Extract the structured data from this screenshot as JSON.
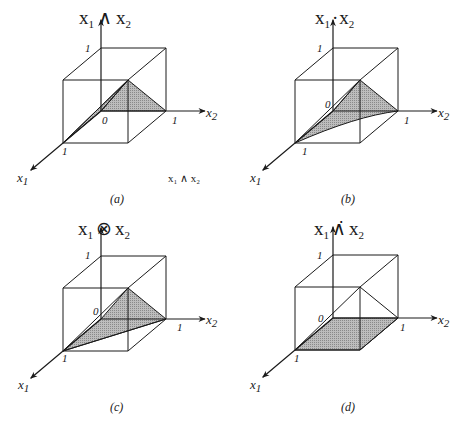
{
  "figure": {
    "panels": [
      {
        "id": "a",
        "title_base1": "x",
        "title_sub1": "1",
        "title_op": "∧",
        "title_base2": "x",
        "title_sub2": "2",
        "caption": "(a)",
        "note": "x₁ ∧ x₂",
        "surface": "min",
        "x1_label": "x",
        "x1_sub": "1",
        "x2_label": "x",
        "x2_sub": "2",
        "tick_zero": "0",
        "tick_one_x1": "1",
        "tick_one_x2": "1",
        "tick_one_z": "1"
      },
      {
        "id": "b",
        "title_base1": "x",
        "title_sub1": "1",
        "title_op": "·",
        "title_base2": "x",
        "title_sub2": "2",
        "caption": "(b)",
        "note": "",
        "surface": "product",
        "x1_label": "x",
        "x1_sub": "1",
        "x2_label": "x",
        "x2_sub": "2",
        "tick_zero": "0",
        "tick_one_x1": "1",
        "tick_one_x2": "1",
        "tick_one_z": "1"
      },
      {
        "id": "c",
        "title_base1": "x",
        "title_sub1": "1",
        "title_op": "⊗",
        "title_base2": "x",
        "title_sub2": "2",
        "caption": "(c)",
        "note": "",
        "surface": "lukasiewicz",
        "x1_label": "x",
        "x1_sub": "1",
        "x2_label": "x",
        "x2_sub": "2",
        "tick_zero": "0",
        "tick_one_x1": "1",
        "tick_one_x2": "1",
        "tick_one_z": "1"
      },
      {
        "id": "d",
        "title_base1": "x",
        "title_sub1": "1",
        "title_op": "∧̇",
        "title_base2": "x",
        "title_sub2": "2",
        "caption": "(d)",
        "note": "",
        "surface": "drastic",
        "x1_label": "x",
        "x1_sub": "1",
        "x2_label": "x",
        "x2_sub": "2",
        "tick_zero": "0",
        "tick_one_x1": "1",
        "tick_one_x2": "1",
        "tick_one_z": "1"
      }
    ]
  }
}
